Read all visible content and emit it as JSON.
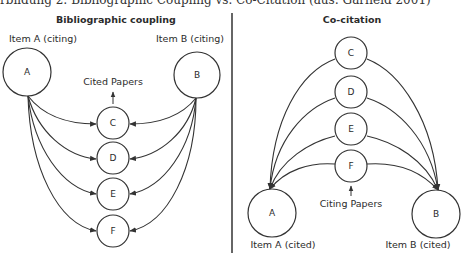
{
  "caption": "rbildung 2: Bibliographic Coupling vs. Co-Citation (aus: Garfield 2001)",
  "left_panel": {
    "title": "Bibliographic coupling",
    "item_a_label": "Item A (citing)",
    "item_b_label": "Item B (citing)",
    "node_a": "A",
    "node_b": "B",
    "group_label": "Cited Papers",
    "nodes": [
      "C",
      "D",
      "E",
      "F"
    ]
  },
  "right_panel": {
    "title": "Co-citation",
    "item_a_label": "Item A (cited)",
    "item_b_label": "Item B (cited)",
    "node_a": "A",
    "node_b": "B",
    "group_label": "Citing Papers",
    "nodes": [
      "C",
      "D",
      "E",
      "F"
    ]
  },
  "colors": {
    "line": "#333333",
    "background": "#ffffff"
  }
}
